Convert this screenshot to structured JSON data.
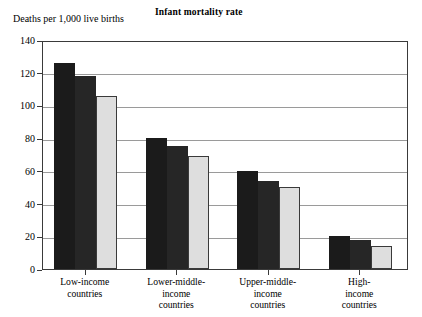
{
  "chart_data": {
    "type": "bar",
    "title": "Infant mortality rate",
    "ylabel": "Deaths per 1,000 live births",
    "xlabel": "",
    "ylim": [
      0,
      140
    ],
    "yticks": [
      0,
      20,
      40,
      60,
      80,
      100,
      120,
      140
    ],
    "ytick_labels": [
      "0",
      "20",
      "40",
      "60",
      "80",
      "100",
      "120",
      "140"
    ],
    "grid": true,
    "legend": "none",
    "categories": [
      "Low-income countries",
      "Lower-middle-income countries",
      "Upper-middle-income countries",
      "High-income countries"
    ],
    "category_lines": [
      [
        "Low-income",
        "countries"
      ],
      [
        "Lower-middle-",
        "income",
        "countries"
      ],
      [
        "Upper-middle-",
        "income",
        "countries"
      ],
      [
        "High-",
        "income",
        "countries"
      ]
    ],
    "series": [
      {
        "name": "series-1",
        "color": "#1b1b1b",
        "values": [
          126,
          80,
          60,
          20
        ]
      },
      {
        "name": "series-2",
        "color": "#262626",
        "values": [
          118,
          75,
          54,
          18
        ]
      },
      {
        "name": "series-3",
        "color": "#dedede",
        "values": [
          106,
          69,
          50,
          14
        ]
      }
    ]
  },
  "figure": {
    "title": "Infant mortality rate",
    "y_axis_caption": "Deaths per 1,000 live births"
  }
}
